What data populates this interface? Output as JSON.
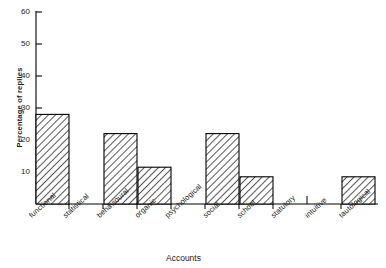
{
  "chart_data": {
    "type": "bar",
    "title": "",
    "xlabel": "Accounts",
    "ylabel": "Percentage of replies",
    "categories": [
      "functional",
      "statistical",
      "behavioural",
      "organic",
      "psychological",
      "social",
      "school",
      "statutory",
      "intuitive",
      "tautological"
    ],
    "values": [
      28,
      0,
      22,
      11.5,
      0,
      22,
      8.5,
      0,
      0,
      8.5
    ],
    "ylim": [
      0,
      60
    ],
    "yticks": [
      10,
      20,
      30,
      40,
      50,
      60
    ],
    "ytick_labels": [
      "10",
      "20",
      "30",
      "40",
      "50",
      "60"
    ],
    "grid": false,
    "legend": null,
    "bar_style": "diagonal-hatch",
    "bar_fill": "#ffffff",
    "bar_edge": "#000000",
    "axis_color": "#000000"
  },
  "axes": {
    "y_title": "Percentage of replies",
    "x_title": "Accounts"
  }
}
